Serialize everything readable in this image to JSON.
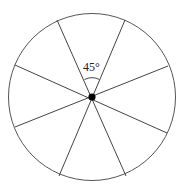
{
  "diagram": {
    "type": "circle divided into 8 equal sectors",
    "sectors": 8,
    "angle_label": "45°",
    "sector_angle_degrees": 45,
    "center_point": "filled dot",
    "colors": {
      "stroke": "#555555",
      "center_dot": "#000000",
      "text": "#222222"
    }
  }
}
